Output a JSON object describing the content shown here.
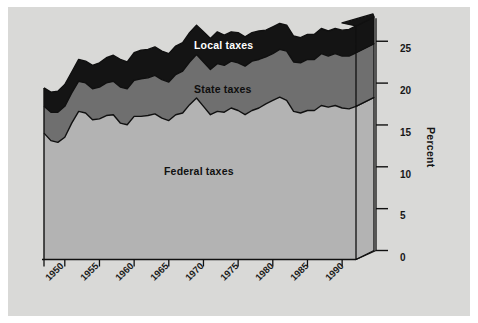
{
  "figure": {
    "background_color": "#d9d9d7",
    "page_color": "#ffffff"
  },
  "axis": {
    "y_title": "Percent",
    "y_ticks": [
      "0",
      "5",
      "10",
      "15",
      "20",
      "25"
    ],
    "x_ticks": [
      "1950",
      "1955",
      "1960",
      "1965",
      "1970",
      "1975",
      "1980",
      "1985",
      "1990"
    ]
  },
  "series_labels": {
    "local": "Local taxes",
    "state": "State taxes",
    "federal": "Federal taxes"
  },
  "chart_data": {
    "type": "area",
    "title": "",
    "subtitle": "",
    "xlabel": "",
    "ylabel": "Percent",
    "stacked": true,
    "grid": false,
    "legend_position": "inline-on-bands",
    "xlim": [
      1947,
      1993
    ],
    "ylim": [
      0,
      27.5
    ],
    "y_ticks": [
      0,
      5,
      10,
      15,
      20,
      25
    ],
    "x_ticks": [
      1950,
      1955,
      1960,
      1965,
      1970,
      1975,
      1980,
      1985,
      1990
    ],
    "colors": {
      "federal": "#b3b3b3",
      "state": "#6f6f6f",
      "local": "#141414",
      "outline": "#101010"
    },
    "x": [
      1947,
      1948,
      1949,
      1950,
      1951,
      1952,
      1953,
      1954,
      1955,
      1956,
      1957,
      1958,
      1959,
      1960,
      1961,
      1962,
      1963,
      1964,
      1965,
      1966,
      1967,
      1968,
      1969,
      1970,
      1971,
      1972,
      1973,
      1974,
      1975,
      1976,
      1977,
      1978,
      1979,
      1980,
      1981,
      1982,
      1983,
      1984,
      1985,
      1986,
      1987,
      1988,
      1989,
      1990,
      1991,
      1992
    ],
    "series": [
      {
        "name": "Federal taxes",
        "values": [
          15.1,
          14.2,
          14.0,
          14.6,
          16.3,
          17.7,
          17.5,
          16.7,
          16.8,
          17.2,
          17.3,
          16.3,
          16.1,
          17.1,
          17.1,
          17.2,
          17.4,
          16.9,
          16.6,
          17.3,
          17.5,
          18.5,
          19.3,
          18.3,
          17.3,
          17.7,
          17.6,
          18.1,
          17.8,
          17.3,
          17.8,
          18.1,
          18.6,
          19.0,
          19.4,
          19.0,
          17.7,
          17.5,
          17.8,
          17.8,
          18.4,
          18.2,
          18.4,
          18.1,
          18.0,
          18.3
        ]
      },
      {
        "name": "State taxes",
        "values": [
          3.2,
          3.4,
          3.6,
          3.7,
          3.6,
          3.6,
          3.6,
          3.7,
          3.8,
          3.9,
          4.0,
          4.3,
          4.3,
          4.3,
          4.5,
          4.5,
          4.6,
          4.6,
          4.6,
          4.8,
          5.0,
          5.1,
          5.2,
          5.3,
          5.4,
          5.7,
          5.6,
          5.6,
          5.7,
          5.8,
          5.9,
          5.8,
          5.6,
          5.6,
          5.7,
          5.9,
          5.9,
          6.0,
          6.1,
          6.1,
          6.2,
          6.1,
          6.2,
          6.2,
          6.3,
          6.4
        ]
      },
      {
        "name": "Local taxes",
        "values": [
          2.2,
          2.4,
          2.5,
          2.6,
          2.5,
          2.6,
          2.6,
          2.8,
          2.9,
          3.0,
          3.1,
          3.3,
          3.2,
          3.3,
          3.4,
          3.4,
          3.4,
          3.4,
          3.4,
          3.4,
          3.4,
          3.5,
          3.5,
          3.6,
          3.7,
          3.8,
          3.6,
          3.5,
          3.6,
          3.5,
          3.4,
          3.4,
          3.2,
          3.2,
          3.1,
          3.1,
          3.1,
          3.0,
          3.0,
          3.0,
          3.0,
          3.0,
          3.0,
          3.1,
          3.2,
          3.2
        ]
      }
    ]
  }
}
